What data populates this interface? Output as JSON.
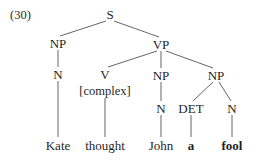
{
  "figure": {
    "example_number": "(30)",
    "sentence": "Kate thought John a fool",
    "type": "syntax-tree"
  },
  "tree": {
    "nodes": [
      {
        "id": "S",
        "label": "S",
        "x": 110,
        "y": 14,
        "style": "plain"
      },
      {
        "id": "NP1",
        "label": "NP",
        "x": 58,
        "y": 43,
        "style": "plain"
      },
      {
        "id": "VP",
        "label": "VP",
        "x": 161,
        "y": 44,
        "style": "plain"
      },
      {
        "id": "N1",
        "label": "N",
        "x": 58,
        "y": 74,
        "style": "plain"
      },
      {
        "id": "V",
        "label": "V",
        "x": 105,
        "y": 74,
        "style": "plain"
      },
      {
        "id": "NP2",
        "label": "NP",
        "x": 161,
        "y": 75,
        "style": "plain"
      },
      {
        "id": "NP3",
        "label": "NP",
        "x": 216,
        "y": 75,
        "style": "plain"
      },
      {
        "id": "COMPLEX",
        "label": "[complex]",
        "x": 105,
        "y": 91,
        "style": "small"
      },
      {
        "id": "N2",
        "label": "N",
        "x": 161,
        "y": 108,
        "style": "plain"
      },
      {
        "id": "DET",
        "label": "DET",
        "x": 191,
        "y": 108,
        "style": "plain"
      },
      {
        "id": "N3",
        "label": "N",
        "x": 232,
        "y": 108,
        "style": "plain"
      }
    ],
    "leaves": [
      {
        "id": "L1",
        "label": "Kate",
        "x": 58,
        "y": 145,
        "bold": false
      },
      {
        "id": "L2",
        "label": "thought",
        "x": 105,
        "y": 145,
        "bold": false
      },
      {
        "id": "L3",
        "label": "John",
        "x": 161,
        "y": 145,
        "bold": false
      },
      {
        "id": "L4",
        "label": "a",
        "x": 191,
        "y": 145,
        "bold": true
      },
      {
        "id": "L5",
        "label": "fool",
        "x": 232,
        "y": 145,
        "bold": true
      }
    ],
    "edges": [
      {
        "from": "S",
        "to": "NP1",
        "x1": 106,
        "y1": 21,
        "x2": 60,
        "y2": 36
      },
      {
        "from": "S",
        "to": "VP",
        "x1": 114,
        "y1": 21,
        "x2": 159,
        "y2": 37
      },
      {
        "from": "NP1",
        "to": "N1",
        "x1": 58,
        "y1": 50,
        "x2": 58,
        "y2": 67
      },
      {
        "from": "VP",
        "to": "V",
        "x1": 157,
        "y1": 51,
        "x2": 108,
        "y2": 67
      },
      {
        "from": "VP",
        "to": "NP2",
        "x1": 161,
        "y1": 51,
        "x2": 161,
        "y2": 68
      },
      {
        "from": "VP",
        "to": "NP3",
        "x1": 166,
        "y1": 51,
        "x2": 213,
        "y2": 68
      },
      {
        "from": "N1",
        "to": "L1",
        "x1": 58,
        "y1": 81,
        "x2": 58,
        "y2": 137
      },
      {
        "from": "V",
        "to": "L2",
        "x1": 105,
        "y1": 98,
        "x2": 105,
        "y2": 137
      },
      {
        "from": "NP2",
        "to": "N2",
        "x1": 161,
        "y1": 82,
        "x2": 161,
        "y2": 101
      },
      {
        "from": "NP3",
        "to": "DET",
        "x1": 213,
        "y1": 82,
        "x2": 193,
        "y2": 101
      },
      {
        "from": "NP3",
        "to": "N3",
        "x1": 219,
        "y1": 82,
        "x2": 231,
        "y2": 101
      },
      {
        "from": "N2",
        "to": "L3",
        "x1": 161,
        "y1": 115,
        "x2": 161,
        "y2": 137
      },
      {
        "from": "DET",
        "to": "L4",
        "x1": 191,
        "y1": 115,
        "x2": 191,
        "y2": 137
      },
      {
        "from": "N3",
        "to": "L5",
        "x1": 232,
        "y1": 115,
        "x2": 232,
        "y2": 137
      }
    ]
  },
  "colors": {
    "background": "#ffffff",
    "text": "#1f1f1f",
    "edge": "#3d3d3d"
  }
}
